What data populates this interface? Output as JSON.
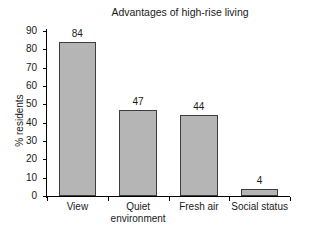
{
  "chart_data": {
    "type": "bar",
    "title": "Advantages of high-rise living",
    "xlabel": "",
    "ylabel": "% residents",
    "categories": [
      "View",
      "Quiet environment",
      "Fresh air",
      "Social status"
    ],
    "category_lines": [
      [
        "View"
      ],
      [
        "Quiet",
        "environment"
      ],
      [
        "Fresh air"
      ],
      [
        "Social status"
      ]
    ],
    "values": [
      84,
      47,
      44,
      4
    ],
    "value_labels": [
      "84",
      "47",
      "44",
      "4"
    ],
    "ylim": [
      0,
      90
    ],
    "yticks": [
      0,
      10,
      20,
      30,
      40,
      50,
      60,
      70,
      80,
      90
    ],
    "ytick_labels": [
      "0",
      "10",
      "20",
      "30",
      "40",
      "50",
      "60",
      "70",
      "80",
      "90"
    ],
    "grid": false,
    "legend": false,
    "bar_fill_color": "#b5b5b5",
    "bar_edge_color": "#3d3d3d",
    "axis_color": "#000000",
    "background_color": "#ffffff"
  }
}
